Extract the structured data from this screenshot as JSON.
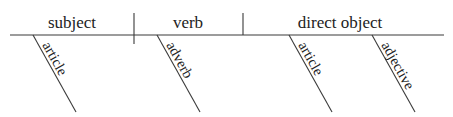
{
  "diagram": {
    "type": "sentence-diagram",
    "colors": {
      "line": "#3a3a3a",
      "text": "#222222",
      "background": "#ffffff"
    },
    "baseline": {
      "slots": [
        {
          "label": "subject"
        },
        {
          "label": "verb"
        },
        {
          "label": "direct object"
        }
      ]
    },
    "modifiers": [
      {
        "label": "article",
        "attaches_to": "subject"
      },
      {
        "label": "adverb",
        "attaches_to": "verb"
      },
      {
        "label": "article",
        "attaches_to": "direct object"
      },
      {
        "label": "adjective",
        "attaches_to": "direct object"
      }
    ]
  }
}
